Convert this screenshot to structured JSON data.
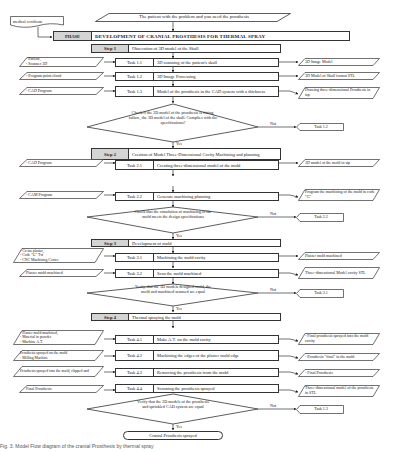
{
  "note": {
    "label": "medical certificate"
  },
  "start": {
    "label": "The patient with the problem and you need the prosthesis"
  },
  "phase": {
    "label": "PHASE",
    "title": "DEVELOPMENT OF CRANIAL PROSTHESIS FOR THERMAL SPRAY"
  },
  "steps": [
    {
      "label": "Step 1",
      "title": "Obsevation of 3D model of the Skull"
    },
    {
      "label": "Step 2",
      "title": "Creation of Model Three-Dimensional Cavity Machining and planning"
    },
    {
      "label": "Step 3",
      "title": "Development of mold"
    },
    {
      "label": "Step 4",
      "title": "Thermal spraying the mold"
    }
  ],
  "tasks": [
    {
      "id": "Task 1.1",
      "desc": "3D scanning of the patient's skull",
      "input": "- Patient,\n- Scanner 3D",
      "output": "3D Image Model"
    },
    {
      "id": "Task 1.2",
      "desc": "3D Image Processing",
      "input": "- Program point cloud",
      "output": "3D Model of Skull format STL"
    },
    {
      "id": "Task 1.3",
      "desc": "Model of the prosthesis in the CAD system with a thickness",
      "input": "- CAD Program",
      "output": "Drawing three-dimensional Prosthesis in stp"
    },
    {
      "id": "Task 2.1",
      "desc": "Creating three-dimensional model of the mold",
      "input": "- CAD Program",
      "output": "3D model of the mold in stp"
    },
    {
      "id": "Task 2.2",
      "desc": "Generate machining planning",
      "input": "- CAM Program",
      "output": "Program the machining of the mold in code \"G\""
    },
    {
      "id": "Task 3.1",
      "desc": "Machining the mold cavity",
      "input": "- Ca tus plaster,\n- Code \"G\" Txt\n- CNC Machining Center",
      "output": "Plaster mold machined"
    },
    {
      "id": "Task 3.2",
      "desc": "Scan the mold machined",
      "input": "Plaster mold machined",
      "output": "Three-dimensional Model cavity STL"
    },
    {
      "id": "Task 4.1",
      "desc": "Make A.T. on the mold cavity",
      "input": "- Plaster mold machined,\n- Material in powder\n- Machine A.T.",
      "output": "- Final prosthesis sprayed into the mold cavity"
    },
    {
      "id": "Task 4.2",
      "desc": "Machining the edges of the plaster mold edge",
      "input": "Prosthesis sprayed on the mold\n- Milling Machine",
      "output": "- Prosthesis \"final\" in the mold"
    },
    {
      "id": "Task 4.3",
      "desc": "Removing the prosthesis from the mold",
      "input": "Prosthesis sprayed into the mold, clipped and",
      "output": "- Final Prosthesis"
    },
    {
      "id": "Task 4.4",
      "desc": "Scanning the prosthesis sprayed",
      "input": "Final Prosthesis",
      "output": "Three-dimensional model of the prosthesis in STL"
    }
  ],
  "decisions": [
    {
      "question": "Check if the 3D model of the prosthesis is fitting, failure, the 3D model of the skull. Complies with the specifications?",
      "no_label": "Not",
      "yes_label": "Yes",
      "no_target": "Task 1.2"
    },
    {
      "question": "Check that the simulation of machining of the mold meets the design specifications",
      "no_label": "Not",
      "yes_label": "Yes",
      "no_target": "Task 2.2"
    },
    {
      "question": "Verify that the 3D models designed mold, the mold and machined scanned are equal",
      "no_label": "Not",
      "yes_label": "Yes",
      "no_target": "Task 3.1"
    },
    {
      "question": "Verify that the 3D models of the prosthesis and sprinkled CAD system are equal",
      "no_label": "Not",
      "yes_label": "Yes",
      "no_target": "Task 1.3"
    }
  ],
  "end": {
    "label": "Cranial Prosthesis sprayed"
  },
  "caption": "Fig. 3. Model Flow diagram of the cranial Prosthesis by thermal spray"
}
